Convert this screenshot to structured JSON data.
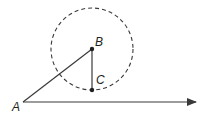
{
  "diagram": {
    "points": {
      "A": {
        "label": "A",
        "x": 23,
        "y": 102
      },
      "B": {
        "label": "B",
        "x": 92,
        "y": 49
      },
      "C": {
        "label": "C",
        "x": 92,
        "y": 90
      }
    },
    "circle": {
      "center": "B",
      "radius": 41,
      "style": "dashed"
    },
    "ray": {
      "from": "A",
      "direction": "right",
      "end_x": 197
    },
    "segments": [
      "AB",
      "BC"
    ],
    "colors": {
      "stroke": "#3a3a3a",
      "fill": "#231f20"
    }
  }
}
